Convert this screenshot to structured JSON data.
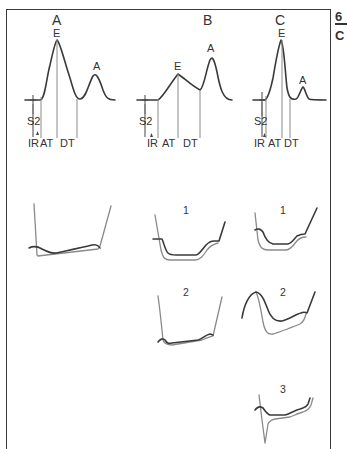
{
  "figure": {
    "side_text": {
      "top": "6",
      "bottom": "C"
    },
    "panels": [
      {
        "id": "A",
        "label": "A",
        "waves": {
          "e": "E",
          "a": "A"
        },
        "intervals": {
          "s2": "S2",
          "ir": "IR",
          "at": "AT",
          "dt": "DT"
        },
        "description": "Tall E wave, smaller A wave"
      },
      {
        "id": "B",
        "label": "B",
        "waves": {
          "e": "E",
          "a": "A"
        },
        "intervals": {
          "s2": "S2",
          "ir": "IR",
          "at": "AT",
          "dt": "DT"
        },
        "description": "Low E wave, taller A wave (prolonged relaxation)"
      },
      {
        "id": "C",
        "label": "C",
        "waves": {
          "e": "E",
          "a": "A"
        },
        "intervals": {
          "s2": "S2",
          "ir": "IR",
          "at": "AT",
          "dt": "DT"
        },
        "description": "Tall narrow E wave, small A wave (restrictive)"
      }
    ],
    "pressure_tracings": {
      "column_a": [
        {
          "label": ""
        }
      ],
      "column_b": [
        {
          "label": "1"
        },
        {
          "label": "2"
        }
      ],
      "column_c": [
        {
          "label": "1"
        },
        {
          "label": "2"
        },
        {
          "label": "3"
        }
      ]
    },
    "colors": {
      "frame": "#3a3a3a",
      "dark_trace": "#3a3a3a",
      "gray_trace": "#8a8a8a",
      "text": "#333333",
      "background": "#ffffff"
    }
  }
}
